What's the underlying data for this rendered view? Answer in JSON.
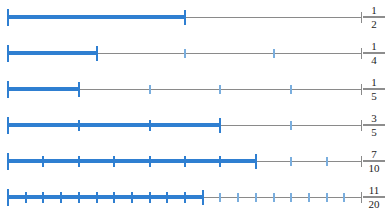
{
  "colors": {
    "fill": "#2f7fd1",
    "tick": "#2f7fd1",
    "tick_empty": "#7aaede",
    "track": "#8a8a8a",
    "background": "#ffffff",
    "label": "#1c1c1c"
  },
  "geometry": {
    "line_start_px": 8,
    "line_end_px": 362,
    "row_height_px": 36,
    "first_row_top_px": 0
  },
  "chart_data": {
    "type": "bar",
    "xlabel": "",
    "ylabel": "",
    "xlim": [
      0,
      1
    ],
    "grid": false,
    "legend": null,
    "categories": [
      "1/2",
      "1/4",
      "1/5",
      "3/5",
      "7/10",
      "11/20"
    ],
    "values": [
      0.5,
      0.25,
      0.2,
      0.6,
      0.7,
      0.55
    ],
    "series": [
      {
        "name": "fraction shaded",
        "values": [
          0.5,
          0.25,
          0.2,
          0.6,
          0.7,
          0.55
        ]
      }
    ]
  },
  "rows": [
    {
      "id": "row-one-half",
      "numerator": "1",
      "denominator": "2",
      "label": "1/2",
      "value": 0.5,
      "divisions": 2,
      "filled_divisions": 1
    },
    {
      "id": "row-one-quarter",
      "numerator": "1",
      "denominator": "4",
      "label": "1/4",
      "value": 0.25,
      "divisions": 4,
      "filled_divisions": 1
    },
    {
      "id": "row-one-fifth",
      "numerator": "1",
      "denominator": "5",
      "label": "1/5",
      "value": 0.2,
      "divisions": 5,
      "filled_divisions": 1
    },
    {
      "id": "row-three-fifths",
      "numerator": "3",
      "denominator": "5",
      "label": "3/5",
      "value": 0.6,
      "divisions": 5,
      "filled_divisions": 3
    },
    {
      "id": "row-seven-tenths",
      "numerator": "7",
      "denominator": "10",
      "label": "7/10",
      "value": 0.7,
      "divisions": 10,
      "filled_divisions": 7
    },
    {
      "id": "row-eleven-twentieths",
      "numerator": "11",
      "denominator": "20",
      "label": "11/20",
      "value": 0.55,
      "divisions": 20,
      "filled_divisions": 11
    }
  ]
}
